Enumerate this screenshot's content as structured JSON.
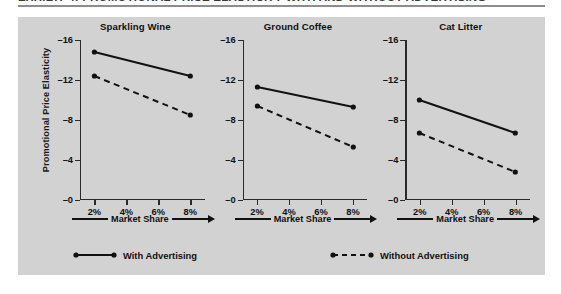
{
  "figure": {
    "headline": "EXHIBIT 4: PROMOTIONAL PRICE ELASTICITY WITH AND WITHOUT ADVERTISING",
    "y_axis_title": "Promotional Price Elasticity",
    "x_axis_title": "Market Share"
  },
  "axis": {
    "y_ticks": [
      "–0",
      "–4",
      "–8",
      "–12",
      "–16"
    ],
    "x_ticks": [
      "2%",
      "4%",
      "6%",
      "8%"
    ]
  },
  "legend": {
    "with_advertising": "With Advertising",
    "without_advertising": "Without Advertising"
  },
  "panels": [
    {
      "title": "Sparkling Wine"
    },
    {
      "title": "Ground Coffee"
    },
    {
      "title": "Cat Litter"
    }
  ],
  "colors": {
    "plate_background": "#d2d2d2",
    "page_background": "#ffffff",
    "ink": "#111111",
    "rule": "#8d8d8d"
  },
  "chart_data": {
    "type": "line",
    "title": "Promotional Price Elasticity With and Without Advertising",
    "xlabel": "Market Share",
    "ylabel": "Promotional Price Elasticity",
    "x": [
      2,
      8
    ],
    "x_tick_labels": [
      "2%",
      "4%",
      "6%",
      "8%"
    ],
    "x_tick_values": [
      2,
      4,
      6,
      8
    ],
    "xlim": [
      1.1,
      8.9
    ],
    "ylim": [
      0,
      -16
    ],
    "y_tick_values": [
      0,
      -4,
      -8,
      -12,
      -16
    ],
    "y_tick_labels": [
      "–0",
      "–4",
      "–8",
      "–12",
      "–16"
    ],
    "y_axis_inverted": true,
    "grid": false,
    "legend_position": "bottom",
    "panels": [
      {
        "title": "Sparkling Wine",
        "series": [
          {
            "name": "With Advertising",
            "style": "solid",
            "values": [
              -14.8,
              -12.4
            ]
          },
          {
            "name": "Without Advertising",
            "style": "dashed",
            "values": [
              -12.4,
              -8.5
            ]
          }
        ]
      },
      {
        "title": "Ground Coffee",
        "series": [
          {
            "name": "With Advertising",
            "style": "solid",
            "values": [
              -11.3,
              -9.3
            ]
          },
          {
            "name": "Without Advertising",
            "style": "dashed",
            "values": [
              -9.4,
              -5.3
            ]
          }
        ]
      },
      {
        "title": "Cat Litter",
        "series": [
          {
            "name": "With Advertising",
            "style": "solid",
            "values": [
              -10.0,
              -6.7
            ]
          },
          {
            "name": "Without Advertising",
            "style": "dashed",
            "values": [
              -6.7,
              -2.8
            ]
          }
        ]
      }
    ]
  }
}
